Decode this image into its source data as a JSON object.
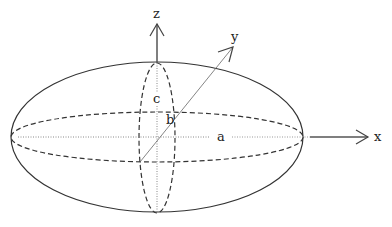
{
  "diagram": {
    "type": "ellipsoid",
    "colors": {
      "stroke": "#333333",
      "axis": "#555555",
      "dotted": "#888888",
      "label": "#222222",
      "background": "#ffffff"
    },
    "axes": {
      "x": "x",
      "y": "y",
      "z": "z"
    },
    "semi_axes": {
      "a": "a",
      "b": "b",
      "c": "c"
    }
  }
}
